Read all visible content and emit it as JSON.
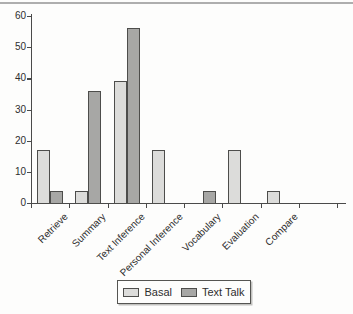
{
  "figure": {
    "background": "#fdfdfc",
    "top_rule_color": "#9a9a9a",
    "axis_color": "#4a4a4a",
    "text_color": "#2e2e2e"
  },
  "chart_data": {
    "type": "bar",
    "title": "",
    "xlabel": "",
    "ylabel": "",
    "categories": [
      "Retrieve",
      "Summary",
      "Text Inference",
      "Personal Inference",
      "Vocabulary",
      "Evaluation",
      "Compare"
    ],
    "series": [
      {
        "name": "Basal",
        "color": "#dcdcda",
        "border": "#4d4d4b",
        "values": [
          17,
          4,
          39,
          17,
          0,
          17,
          4
        ]
      },
      {
        "name": "Text Talk",
        "color": "#a7a7a5",
        "border": "#4d4d4b",
        "values": [
          4,
          36,
          56,
          0,
          4,
          0,
          0
        ]
      }
    ],
    "ylim": [
      0,
      60
    ],
    "yticks": [
      0,
      10,
      20,
      30,
      40,
      50,
      60
    ],
    "grid": false,
    "legend_position": "bottom"
  }
}
